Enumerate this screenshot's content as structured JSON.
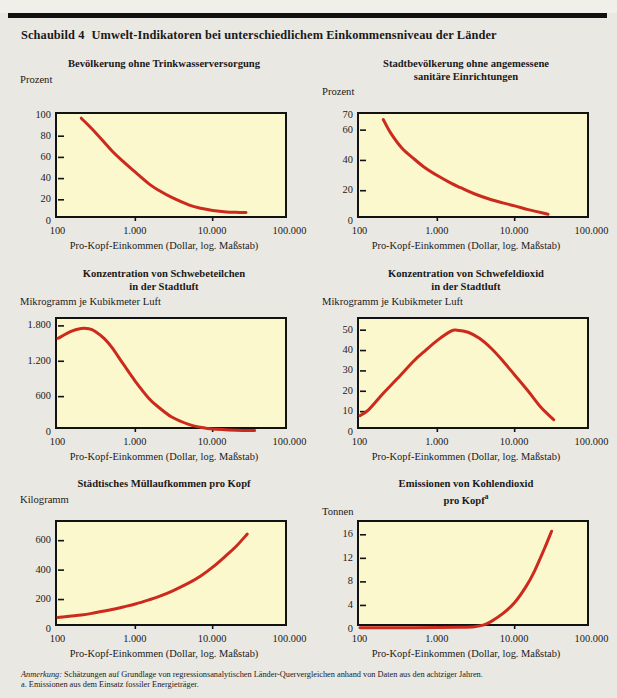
{
  "figure": {
    "number_label": "Schaubild 4",
    "title": "Umwelt-Indikatoren bei unterschiedlichem Einkommensniveau der Länder",
    "x_axis_caption": "Pro-Kopf-Einkommen (Dollar, log. Maßstab)",
    "notes_lead": "Anmerkung:",
    "notes_text": " Schätzungen auf Grundlage von regressionsanalytischen Länder-Quervergleichen anhand von Daten aus den achtziger Jahren.",
    "footnote_a": "a. Emissionen aus dem Einsatz fossiler Energieträger.",
    "curve_color": "#cc2a1c",
    "plot_background": "#fbf8cd",
    "frame_color": "#121212",
    "page_background": "#eae8e2"
  },
  "chart_data": [
    {
      "type": "line",
      "id": "water",
      "title": "Bevölkerung ohne Trinkwasserversorgung",
      "title_lines": [
        "Bevölkerung ohne Trinkwasserversorgung"
      ],
      "ylabel": "Prozent",
      "xlabel": "Pro-Kopf-Einkommen (Dollar, log. Maßstab)",
      "xscale": "log",
      "xlim": [
        100,
        100000
      ],
      "ylim": [
        0,
        100
      ],
      "xticks": [
        100,
        1000,
        10000,
        100000
      ],
      "xticklabels": [
        "100",
        "1.000",
        "10.000",
        "100.000"
      ],
      "yticks": [
        0,
        20,
        40,
        60,
        80,
        100
      ],
      "yticklabels": [
        "0",
        "20",
        "40",
        "60",
        "80",
        "100"
      ],
      "grid": false,
      "legend": "none",
      "x": [
        200,
        300,
        500,
        700,
        1000,
        1500,
        2000,
        3000,
        5000,
        7000,
        10000,
        15000,
        20000,
        27000
      ],
      "values": [
        97,
        84,
        66,
        56,
        46,
        35,
        29,
        22,
        15,
        12,
        10,
        8.6,
        8.2,
        8
      ]
    },
    {
      "type": "line",
      "id": "sanitation",
      "title": "Stadtbevölkerung ohne angemessene sanitäre Einrichtungen",
      "title_lines": [
        "Stadtbevölkerung ohne angemessene",
        "sanitäre Einrichtungen"
      ],
      "ylabel": "Prozent",
      "xlabel": "Pro-Kopf-Einkommen (Dollar, log. Maßstab)",
      "xscale": "log",
      "xlim": [
        100,
        100000
      ],
      "ylim": [
        0,
        70
      ],
      "xticks": [
        100,
        1000,
        10000,
        100000
      ],
      "xticklabels": [
        "100",
        "1.000",
        "10.000",
        "100.000"
      ],
      "yticks": [
        0,
        20,
        40,
        60,
        70
      ],
      "yticklabels": [
        "0",
        "20",
        "40",
        "60",
        "70"
      ],
      "grid": false,
      "legend": "none",
      "x": [
        200,
        250,
        350,
        500,
        700,
        1000,
        1500,
        2000,
        3000,
        5000,
        7000,
        10000,
        15000,
        20000,
        27000
      ],
      "values": [
        67,
        58,
        48,
        41,
        35,
        30,
        25,
        22,
        18,
        14,
        12,
        10,
        7.5,
        6,
        4.5
      ]
    },
    {
      "type": "line",
      "id": "particulates",
      "title": "Konzentration von Schwebeteilchen in der Stadtluft",
      "title_lines": [
        "Konzentration von Schwebeteilchen",
        "in der Stadtluft"
      ],
      "ylabel": "Mikrogramm je Kubikmeter Luft",
      "xlabel": "Pro-Kopf-Einkommen (Dollar, log. Maßstab)",
      "xscale": "log",
      "xlim": [
        100,
        100000
      ],
      "ylim": [
        0,
        1900
      ],
      "xticks": [
        100,
        1000,
        10000,
        100000
      ],
      "xticklabels": [
        "100",
        "1.000",
        "10.000",
        "100.000"
      ],
      "yticks": [
        0,
        600,
        1200,
        1800
      ],
      "yticklabels": [
        "0",
        "600",
        "1.200",
        "1.800"
      ],
      "grid": false,
      "legend": "none",
      "x": [
        100,
        150,
        200,
        250,
        300,
        400,
        500,
        700,
        1000,
        1500,
        2000,
        3000,
        5000,
        7000,
        10000,
        20000,
        35000
      ],
      "values": [
        1590,
        1710,
        1755,
        1750,
        1710,
        1580,
        1430,
        1150,
        860,
        570,
        420,
        250,
        125,
        80,
        50,
        30,
        25
      ]
    },
    {
      "type": "line",
      "id": "sulphur-dioxide",
      "title": "Konzentration von Schwefeldioxid in der Stadtluft",
      "title_lines": [
        "Konzentration von Schwefeldioxid",
        "in der Stadtluft"
      ],
      "ylabel": "Mikrogramm je Kubikmeter Luft",
      "xlabel": "Pro-Kopf-Einkommen (Dollar, log. Maßstab)",
      "xscale": "log",
      "xlim": [
        100,
        100000
      ],
      "ylim": [
        0,
        55
      ],
      "xticks": [
        100,
        1000,
        10000,
        100000
      ],
      "xticklabels": [
        "100",
        "1.000",
        "10.000",
        "100.000"
      ],
      "yticks": [
        0,
        10,
        20,
        30,
        40,
        50
      ],
      "yticklabels": [
        "0",
        "10",
        "20",
        "30",
        "40",
        "50"
      ],
      "grid": false,
      "legend": "none",
      "x": [
        100,
        130,
        200,
        300,
        500,
        700,
        1000,
        1500,
        1800,
        2500,
        3500,
        5000,
        7000,
        10000,
        15000,
        22000,
        32000
      ],
      "values": [
        8,
        11,
        19,
        26,
        35,
        40,
        45,
        49.5,
        50,
        49,
        46,
        41,
        35,
        28,
        20,
        12,
        6
      ]
    },
    {
      "type": "line",
      "id": "municipal-waste",
      "title": "Städtisches Müllaufkommen pro Kopf",
      "title_lines": [
        "Städtisches Müllaufkommen pro Kopf"
      ],
      "ylabel": "Kilogramm",
      "xlabel": "Pro-Kopf-Einkommen (Dollar, log. Maßstab)",
      "xscale": "log",
      "xlim": [
        100,
        100000
      ],
      "ylim": [
        0,
        720
      ],
      "xticks": [
        100,
        1000,
        10000,
        100000
      ],
      "xticklabels": [
        "100",
        "1.000",
        "10.000",
        "100.000"
      ],
      "yticks": [
        0,
        200,
        400,
        600
      ],
      "yticklabels": [
        "0",
        "200",
        "400",
        "600"
      ],
      "grid": false,
      "legend": "none",
      "x": [
        100,
        200,
        300,
        500,
        700,
        1000,
        1500,
        2000,
        3000,
        5000,
        7000,
        10000,
        15000,
        20000,
        28000
      ],
      "values": [
        78,
        95,
        110,
        132,
        150,
        170,
        198,
        220,
        258,
        315,
        360,
        420,
        500,
        560,
        645
      ]
    },
    {
      "type": "line",
      "id": "carbon-dioxide",
      "title": "Emissionen von Kohlendioxid pro Kopf",
      "title_lines": [
        "Emissionen von Kohlendioxid",
        "pro Kopf"
      ],
      "title_superscript": "a",
      "ylabel": "Tonnen",
      "xlabel": "Pro-Kopf-Einkommen (Dollar, log. Maßstab)",
      "xscale": "log",
      "xlim": [
        100,
        100000
      ],
      "ylim": [
        0,
        18
      ],
      "xticks": [
        100,
        1000,
        10000,
        100000
      ],
      "xticklabels": [
        "100",
        "1.000",
        "10.000",
        "100.000"
      ],
      "yticks": [
        0,
        4,
        8,
        12,
        16
      ],
      "yticklabels": [
        "0",
        "4",
        "8",
        "12",
        "16"
      ],
      "grid": false,
      "legend": "none",
      "x": [
        100,
        300,
        1000,
        2000,
        3000,
        4000,
        5000,
        7000,
        10000,
        14000,
        18000,
        24000,
        30000
      ],
      "values": [
        0.2,
        0.2,
        0.25,
        0.3,
        0.4,
        0.7,
        1.3,
        2.6,
        4.5,
        7.2,
        9.8,
        13.5,
        16.6
      ]
    }
  ]
}
